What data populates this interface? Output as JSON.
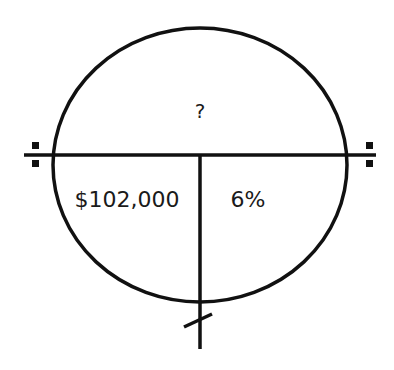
{
  "diagram": {
    "type": "time-value-of-money-circle",
    "top_section": {
      "label": "?"
    },
    "bottom_left_section": {
      "label": "$102,000"
    },
    "bottom_right_section": {
      "label": "6%"
    },
    "colors": {
      "stroke": "#111111",
      "text": "#1a1a1a",
      "background": "#ffffff"
    }
  }
}
